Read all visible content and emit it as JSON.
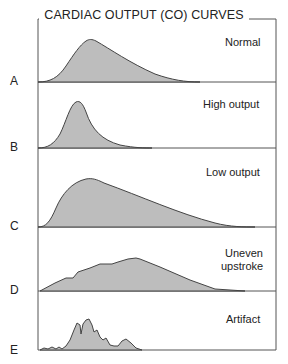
{
  "title": "CARDIAC OUTPUT (CO) CURVES",
  "panels": [
    {
      "letter": "A",
      "label": "Normal",
      "label2": ""
    },
    {
      "letter": "B",
      "label": "High output",
      "label2": ""
    },
    {
      "letter": "C",
      "label": "Low output",
      "label2": ""
    },
    {
      "letter": "D",
      "label": "Uneven",
      "label2": "upstroke"
    },
    {
      "letter": "E",
      "label": "Artifact",
      "label2": ""
    }
  ],
  "colors": {
    "fill": "#bdbdbd",
    "stroke": "#444444",
    "border": "#555555"
  }
}
